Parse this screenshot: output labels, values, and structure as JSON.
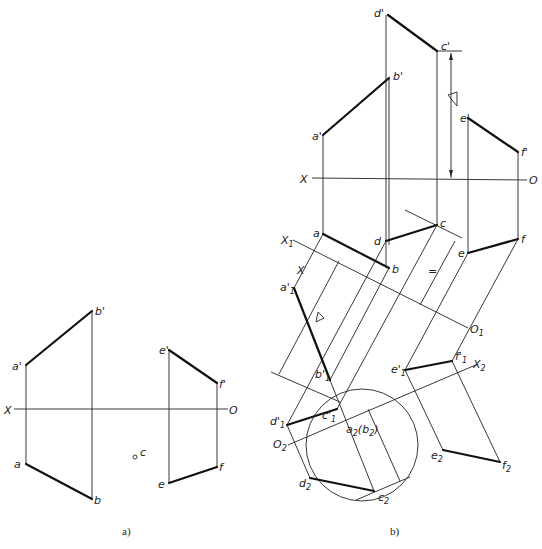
{
  "figure": {
    "panels": [
      {
        "id": "a",
        "caption": "a)"
      },
      {
        "id": "b",
        "caption": "b)"
      }
    ]
  },
  "panel_a": {
    "axis": {
      "left": "X",
      "right": "O"
    },
    "labels": {
      "a_prime": "a'",
      "b_prime": "b'",
      "a": "a",
      "b": "b",
      "e_prime": "e'",
      "f_prime": "f'",
      "e": "e",
      "f": "f",
      "c": "c"
    }
  },
  "panel_b": {
    "axis": {
      "left": "X",
      "right": "O"
    },
    "axis1": {
      "left": "X",
      "left_sub": "1",
      "right": "O",
      "right_sub": "1"
    },
    "axis2": {
      "left": "O",
      "left_sub": "2",
      "right": "X",
      "right_sub": "2"
    },
    "labels": {
      "d_prime": "d'",
      "c_prime": "c'",
      "b_prime": "b'",
      "a_prime": "a'",
      "e_prime": "e'",
      "f_prime": "f'",
      "a": "a",
      "b": "b",
      "c": "c",
      "d": "d",
      "e": "e",
      "f": "f",
      "a1": "a'",
      "b1": "b'",
      "c1": "c'",
      "d1": "d'",
      "e1": "e'",
      "f1": "f'",
      "sub1": "1",
      "sub2": "2",
      "a2b2": "a",
      "b2_paren": "(b",
      "paren_close": ")",
      "c2": "c",
      "d2": "d",
      "e2": "e",
      "f2": "f"
    },
    "marks": {
      "equal": "=",
      "distance_triangle": "triangle"
    }
  }
}
